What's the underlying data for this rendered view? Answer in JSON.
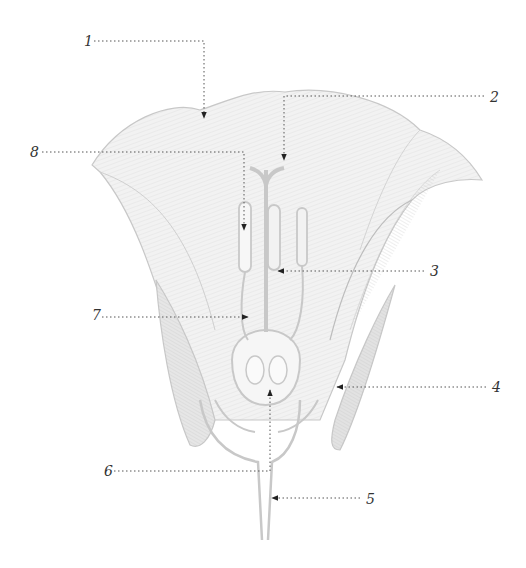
{
  "diagram": {
    "colors": {
      "background": "#ffffff",
      "outline": "#c8c8c8",
      "hatch": "#b5b5b5",
      "shade": "#e2e2e2",
      "leader_line": "#555555",
      "arrowhead": "#222222",
      "label_text": "#333333"
    },
    "labels": [
      {
        "id": "1",
        "text": "1",
        "x": 84,
        "y": 34
      },
      {
        "id": "2",
        "text": "2",
        "x": 490,
        "y": 90
      },
      {
        "id": "3",
        "text": "3",
        "x": 430,
        "y": 264
      },
      {
        "id": "4",
        "text": "4",
        "x": 492,
        "y": 380
      },
      {
        "id": "5",
        "text": "5",
        "x": 366,
        "y": 492
      },
      {
        "id": "6",
        "text": "6",
        "x": 104,
        "y": 464
      },
      {
        "id": "7",
        "text": "7",
        "x": 92,
        "y": 308
      },
      {
        "id": "8",
        "text": "8",
        "x": 30,
        "y": 145
      }
    ]
  }
}
